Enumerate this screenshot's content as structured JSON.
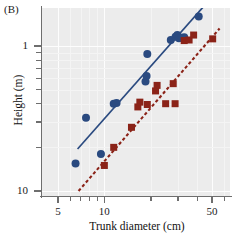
{
  "figure": {
    "panel_label": "(B)",
    "xlabel": "Trunk diameter (cm)",
    "ylabel": "Height (m)"
  },
  "axes": {
    "x_tick_labels": [
      "5",
      "10",
      "50"
    ],
    "y_tick_labels": [
      "10",
      "1"
    ]
  },
  "colors": {
    "blue_series": "#2a4a80",
    "red_series": "#8b2318",
    "plot_background": "#ececec",
    "gridline": "#fdfdfd",
    "axis": "#6e6e6e",
    "text": "#111111"
  },
  "chart_data": {
    "type": "scatter",
    "title": "(B)",
    "xlabel": "Trunk diameter (cm)",
    "ylabel": "Height (m)",
    "xscale": "log",
    "yscale": "log",
    "xlim": [
      4.2,
      62
    ],
    "ylim": [
      0.82,
      26
    ],
    "x_ticks_major": [
      5,
      10,
      50
    ],
    "x_ticks_minor": [
      6,
      7,
      8,
      9,
      20,
      30,
      40,
      60
    ],
    "y_ticks_major": [
      1,
      10
    ],
    "y_ticks_minor": [
      2,
      3,
      4,
      5,
      6,
      7,
      8,
      9,
      20
    ],
    "grid": true,
    "legend_position": "none",
    "series": [
      {
        "name": "blue-circles",
        "marker": "circle",
        "color": "#2a4a80",
        "points": [
          [
            6.5,
            1.55
          ],
          [
            7.6,
            3.2
          ],
          [
            9.5,
            1.8
          ],
          [
            11.5,
            4.0
          ],
          [
            12.0,
            4.05
          ],
          [
            18.5,
            5.7
          ],
          [
            18.8,
            6.2
          ],
          [
            19.0,
            8.8
          ],
          [
            27.0,
            11.0
          ],
          [
            29.0,
            11.6
          ],
          [
            29.8,
            11.9
          ],
          [
            30.5,
            11.3
          ],
          [
            31.5,
            11.4
          ],
          [
            33.0,
            11.5
          ],
          [
            41.0,
            16.0
          ],
          [
            48.0,
            21.5
          ],
          [
            51.0,
            21.8
          ]
        ],
        "fit_line": {
          "style": "solid",
          "x": [
            6.7,
            49.5
          ],
          "y": [
            1.95,
            21.5
          ]
        }
      },
      {
        "name": "red-squares",
        "marker": "square",
        "color": "#8b2318",
        "points": [
          [
            10.0,
            1.5
          ],
          [
            11.5,
            2.0
          ],
          [
            15.0,
            2.75
          ],
          [
            16.5,
            3.8
          ],
          [
            17.0,
            4.1
          ],
          [
            19.0,
            3.95
          ],
          [
            21.5,
            4.9
          ],
          [
            22.0,
            5.35
          ],
          [
            25.0,
            4.0
          ],
          [
            28.0,
            5.5
          ],
          [
            28.8,
            4.0
          ],
          [
            33.0,
            10.9
          ],
          [
            35.5,
            11.0
          ],
          [
            38.0,
            11.9
          ],
          [
            50.5,
            11.2
          ]
        ],
        "fit_line": {
          "style": "dashed",
          "x": [
            6.8,
            56.0
          ],
          "y": [
            1.0,
            13.2
          ]
        }
      }
    ]
  }
}
